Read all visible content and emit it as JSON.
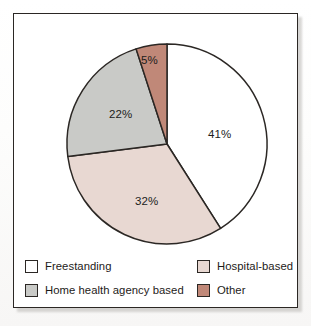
{
  "figure": {
    "frame_border_color": "#2b2724",
    "background": "#ffffff"
  },
  "chart_data": {
    "type": "pie",
    "title": "",
    "subtitle": "",
    "xlabel": "",
    "ylabel": "",
    "legend_position": "bottom",
    "grid": false,
    "start_angle_deg": 0,
    "direction": "clockwise",
    "categories": [
      "Freestanding",
      "Hospital-based",
      "Home health agency based",
      "Other"
    ],
    "values": [
      41,
      32,
      22,
      5
    ],
    "value_labels": [
      "41%",
      "32%",
      "22%",
      "5%"
    ],
    "colors": [
      "#ffffff",
      "#e8d8d2",
      "#c9cac7",
      "#c08878"
    ],
    "slices": [
      {
        "name": "Freestanding",
        "value": 41,
        "label": "41%",
        "color": "#ffffff",
        "label_x": 194,
        "label_y": 114
      },
      {
        "name": "Hospital-based",
        "value": 32,
        "label": "32%",
        "color": "#e8d8d2",
        "label_x": 121,
        "label_y": 181
      },
      {
        "name": "Home health agency based",
        "value": 22,
        "label": "22%",
        "color": "#c9cac7",
        "label_x": 95,
        "label_y": 94
      },
      {
        "name": "Other",
        "value": 5,
        "label": "5%",
        "color": "#c08878",
        "label_x": 127,
        "label_y": 40
      }
    ]
  },
  "legend": {
    "items": [
      {
        "label": "Freestanding",
        "color": "#ffffff",
        "swatch": "legend-swatch-freestanding"
      },
      {
        "label": "Hospital-based",
        "color": "#e8d8d2",
        "swatch": "legend-swatch-hospital-based"
      },
      {
        "label": "Home health agency based",
        "color": "#c9cac7",
        "swatch": "legend-swatch-home-health-agency-based"
      },
      {
        "label": "Other",
        "color": "#c08878",
        "swatch": "legend-swatch-other"
      }
    ]
  }
}
